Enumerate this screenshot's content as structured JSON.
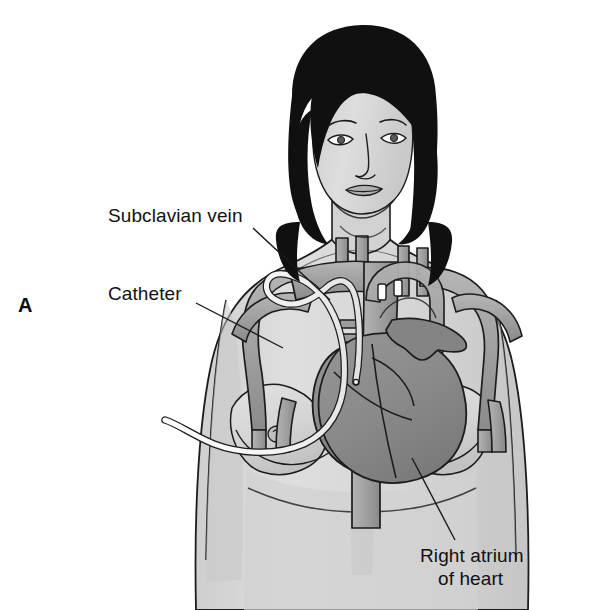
{
  "figure": {
    "panel_letter": "A",
    "type": "medical-illustration",
    "view": "anterior chest, female torso",
    "background_color": "#ffffff"
  },
  "labels": [
    {
      "id": "subclavian-vein",
      "text": "Subclavian vein",
      "x": 108,
      "y": 222,
      "anchor": "start",
      "leader": {
        "x1": 253,
        "y1": 228,
        "x2": 330,
        "y2": 300
      }
    },
    {
      "id": "catheter",
      "text": "Catheter",
      "x": 108,
      "y": 300,
      "anchor": "start",
      "leader": {
        "x1": 196,
        "y1": 303,
        "x2": 283,
        "y2": 348
      }
    },
    {
      "id": "right-atrium-of-heart",
      "text_line1": "Right atrium",
      "text_line2": "of heart",
      "x": 420,
      "y": 562,
      "anchor": "start",
      "leader": {
        "x1": 412,
        "y1": 458,
        "x2": 455,
        "y2": 540
      }
    }
  ],
  "palette": {
    "background": "#ffffff",
    "skin": "#d9d9d9",
    "skin_shadow": "#c4c4c4",
    "skin_highlight": "#e6e6e6",
    "hair": "#101010",
    "vessel": "#a8a8a8",
    "vessel_shadow": "#8f8f8f",
    "heart": "#8c8c8c",
    "heart_shadow": "#7a7a7a",
    "catheter": "#fbfbfb",
    "outline": "#1c1c1c"
  },
  "anatomy": {
    "structures": [
      {
        "name": "head",
        "label": "head and face"
      },
      {
        "name": "hair",
        "label": "hair"
      },
      {
        "name": "neck",
        "label": "neck"
      },
      {
        "name": "torso",
        "label": "chest and torso"
      },
      {
        "name": "left-breast",
        "label": "breast (viewer left)"
      },
      {
        "name": "right-breast",
        "label": "breast (viewer right)"
      },
      {
        "name": "internal-jugular-veins",
        "label": "internal jugular veins"
      },
      {
        "name": "subclavian-vein-left",
        "label": "subclavian vein (viewer left)"
      },
      {
        "name": "subclavian-vein-right",
        "label": "subclavian vein (viewer right)"
      },
      {
        "name": "brachiocephalic-veins",
        "label": "brachiocephalic veins"
      },
      {
        "name": "superior-vena-cava",
        "label": "superior vena cava"
      },
      {
        "name": "inferior-vena-cava",
        "label": "inferior vena cava"
      },
      {
        "name": "aortic-arch",
        "label": "aortic arch"
      },
      {
        "name": "heart",
        "label": "heart"
      },
      {
        "name": "right-atrium",
        "label": "right atrium"
      },
      {
        "name": "catheter-tube",
        "label": "central venous catheter"
      },
      {
        "name": "axillary-vein-left",
        "label": "axillary vein (viewer left)"
      },
      {
        "name": "axillary-vein-right",
        "label": "axillary vein (viewer right)"
      }
    ]
  }
}
